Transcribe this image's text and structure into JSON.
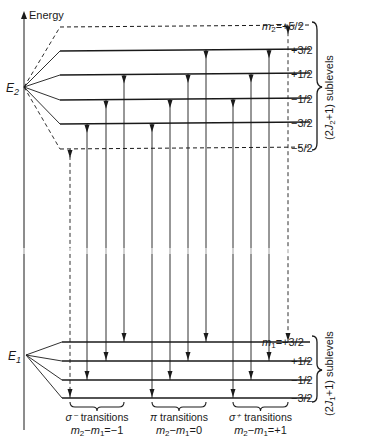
{
  "axis": {
    "label": "Energy"
  },
  "upper_level": {
    "name": "E",
    "subscript": "2",
    "m_prefix": "m",
    "m_subscript": "2",
    "sublevels": [
      {
        "m": "+5/2",
        "label": "=+5/2",
        "y": 26,
        "dashed": true
      },
      {
        "m": "+3/2",
        "label": "+3/2",
        "y": 50,
        "dashed": false
      },
      {
        "m": "+1/2",
        "label": "+1/2",
        "y": 74,
        "dashed": false
      },
      {
        "m": "-1/2",
        "label": "−1/2",
        "y": 99,
        "dashed": false
      },
      {
        "m": "-3/2",
        "label": "−3/2",
        "y": 123,
        "dashed": false
      },
      {
        "m": "-5/2",
        "label": "−5/2",
        "y": 148,
        "dashed": true
      }
    ],
    "brace_label": "(2J₂+1) sublevels",
    "brace_label_parts": {
      "pre": "(2",
      "J": "J",
      "sub": "2",
      "post": "+1)  sublevels"
    }
  },
  "lower_level": {
    "name": "E",
    "subscript": "1",
    "m_prefix": "m",
    "m_subscript": "1",
    "sublevels": [
      {
        "m": "+3/2",
        "label": "=+3/2",
        "y": 342
      },
      {
        "m": "+1/2",
        "label": "+1/2",
        "y": 361
      },
      {
        "m": "-1/2",
        "label": "−1/2",
        "y": 380
      },
      {
        "m": "-3/2",
        "label": "−3/2",
        "y": 398
      }
    ],
    "brace_label": "(2J₁+1) sublevels",
    "brace_label_parts": {
      "pre": "(2",
      "J": "J",
      "sub": "1",
      "post": "+1) sublevels"
    }
  },
  "transitions": [
    {
      "group": "sigma-minus",
      "from": "-3/2",
      "to": "-1/2",
      "x": 87
    },
    {
      "group": "sigma-minus",
      "from": "-1/2",
      "to": "+1/2",
      "x": 106
    },
    {
      "group": "sigma-minus",
      "from": "+1/2",
      "to": "+3/2",
      "x": 124
    },
    {
      "group": "sigma-minus",
      "from": "-5/2",
      "to": "-3/2",
      "x": 70,
      "dashed": true
    },
    {
      "group": "pi",
      "from": "-3/2",
      "to": "-3/2",
      "x": 152
    },
    {
      "group": "pi",
      "from": "-1/2",
      "to": "-1/2",
      "x": 170
    },
    {
      "group": "pi",
      "from": "+1/2",
      "to": "+1/2",
      "x": 188
    },
    {
      "group": "pi",
      "from": "+3/2",
      "to": "+3/2",
      "x": 206
    },
    {
      "group": "sigma-plus",
      "from": "-1/2",
      "to": "-3/2",
      "x": 233
    },
    {
      "group": "sigma-plus",
      "from": "+1/2",
      "to": "-1/2",
      "x": 251
    },
    {
      "group": "sigma-plus",
      "from": "+3/2",
      "to": "+1/2",
      "x": 269
    },
    {
      "group": "sigma-plus",
      "from": "+5/2",
      "to": "+3/2",
      "x": 288,
      "dashed": true
    }
  ],
  "groups": [
    {
      "id": "sigma-minus",
      "title_symbol": "σ⁻",
      "title_text": " transitions",
      "rule": {
        "a": "m",
        "a_sub": "2",
        "b": "m",
        "b_sub": "1",
        "value": "=−1"
      },
      "x1": 70,
      "x2": 124
    },
    {
      "id": "pi",
      "title_symbol": "π",
      "title_text": " transitions",
      "rule": {
        "a": "m",
        "a_sub": "2",
        "b": "m",
        "b_sub": "1",
        "value": "=0"
      },
      "x1": 152,
      "x2": 206
    },
    {
      "id": "sigma-plus",
      "title_symbol": "σ⁺",
      "title_text": " transitions",
      "rule": {
        "a": "m",
        "a_sub": "2",
        "b": "m",
        "b_sub": "1",
        "value": "=+1"
      },
      "x1": 233,
      "x2": 288
    }
  ]
}
